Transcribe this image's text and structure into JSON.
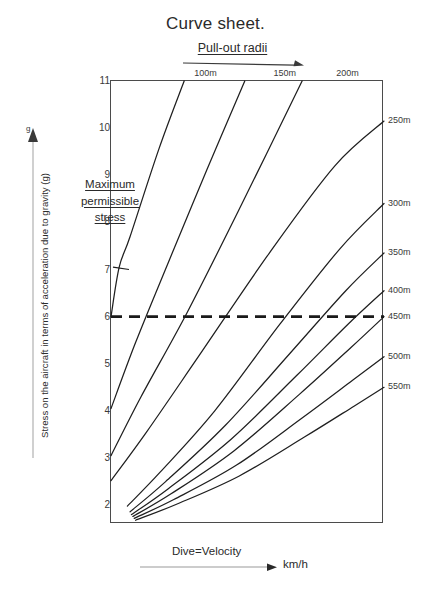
{
  "title": "Curve sheet.",
  "pullout": {
    "label": "Pull-out radii",
    "arrow_icon": "arrow-right-icon"
  },
  "annotation": {
    "line1": "Maximum",
    "line2": "permissible",
    "line3": "stress"
  },
  "yaxis": {
    "caption": "Stress on the aircraft in terms of acceleration due to gravity (g)",
    "unit_marker": "g",
    "arrow_icon": "arrow-up-icon",
    "ticks": [
      11,
      10,
      9,
      8,
      7,
      6,
      5,
      4,
      3,
      2
    ]
  },
  "xaxis": {
    "label": "Dive=Velocity",
    "unit": "km/h",
    "arrow_icon": "arrow-right-icon"
  },
  "chart_data": {
    "type": "line",
    "title": "Curve sheet.",
    "xlabel": "Dive=Velocity  km/h",
    "ylabel": "Stress on the aircraft in terms of acceleration due to gravity (g)",
    "ylim": [
      1.6,
      11
    ],
    "yticks": [
      2,
      3,
      4,
      5,
      6,
      7,
      8,
      9,
      10,
      11
    ],
    "xlim": [
      0,
      1
    ],
    "xticks": [],
    "grid": false,
    "legend_position": "curve-end-labels",
    "annotations": [
      {
        "text": "Maximum permissible stress",
        "kind": "pointer-to-leftmost-curve",
        "x": 0.0,
        "y": 8.6
      },
      {
        "text": "Pull-out radii",
        "kind": "top-axis-direction-arrow",
        "direction": "right"
      },
      {
        "text": "Dive=Velocity",
        "kind": "bottom-axis-direction-arrow",
        "direction": "right"
      }
    ],
    "reference_lines": [
      {
        "orientation": "horizontal",
        "value": 6,
        "style": "dashed",
        "label": "Maximum permissible stress",
        "color": "#1a1a1a"
      }
    ],
    "series": [
      {
        "name": "100m",
        "label_position": "top",
        "label_x_frac": 0.35,
        "exits": "top",
        "points": [
          [
            0.0,
            6.0
          ],
          [
            0.03,
            7.05
          ],
          [
            0.07,
            7.7
          ],
          [
            0.175,
            9.55
          ],
          [
            0.268,
            11.0
          ]
        ]
      },
      {
        "name": "150m",
        "label_position": "top",
        "label_x_frac": 0.64,
        "exits": "top",
        "points": [
          [
            0.0,
            4.05
          ],
          [
            0.09,
            5.45
          ],
          [
            0.21,
            7.15
          ],
          [
            0.35,
            9.1
          ],
          [
            0.49,
            11.0
          ]
        ]
      },
      {
        "name": "200m",
        "label_position": "top",
        "label_x_frac": 0.87,
        "exits": "top",
        "points": [
          [
            0.0,
            3.05
          ],
          [
            0.11,
            4.3
          ],
          [
            0.28,
            6.1
          ],
          [
            0.48,
            8.4
          ],
          [
            0.7,
            11.0
          ]
        ]
      },
      {
        "name": "250m",
        "label_position": "right",
        "label_y": 10.15,
        "exits": "right",
        "points": [
          [
            0.0,
            2.52
          ],
          [
            0.13,
            3.55
          ],
          [
            0.32,
            5.15
          ],
          [
            0.58,
            7.35
          ],
          [
            0.82,
            9.2
          ],
          [
            1.0,
            10.15
          ]
        ]
      },
      {
        "name": "300m",
        "label_position": "right",
        "label_y": 8.4,
        "exits": "right",
        "points": [
          [
            0.06,
            1.98
          ],
          [
            0.18,
            2.7
          ],
          [
            0.38,
            4.0
          ],
          [
            0.62,
            5.85
          ],
          [
            0.84,
            7.45
          ],
          [
            1.0,
            8.4
          ]
        ]
      },
      {
        "name": "350m",
        "label_position": "right",
        "label_y": 7.35,
        "exits": "right",
        "points": [
          [
            0.07,
            1.86
          ],
          [
            0.2,
            2.5
          ],
          [
            0.42,
            3.7
          ],
          [
            0.66,
            5.25
          ],
          [
            0.86,
            6.55
          ],
          [
            1.0,
            7.35
          ]
        ]
      },
      {
        "name": "400m",
        "label_position": "right",
        "label_y": 6.55,
        "exits": "right",
        "points": [
          [
            0.075,
            1.8
          ],
          [
            0.21,
            2.35
          ],
          [
            0.44,
            3.4
          ],
          [
            0.68,
            4.75
          ],
          [
            0.87,
            5.85
          ],
          [
            1.0,
            6.55
          ]
        ]
      },
      {
        "name": "450m",
        "label_position": "right",
        "label_y": 6.0,
        "exits": "right",
        "points": [
          [
            0.08,
            1.76
          ],
          [
            0.22,
            2.24
          ],
          [
            0.45,
            3.15
          ],
          [
            0.69,
            4.35
          ],
          [
            0.88,
            5.35
          ],
          [
            1.0,
            6.0
          ]
        ]
      },
      {
        "name": "500m",
        "label_position": "right",
        "label_y": 5.15,
        "exits": "right",
        "points": [
          [
            0.085,
            1.72
          ],
          [
            0.23,
            2.12
          ],
          [
            0.46,
            2.85
          ],
          [
            0.7,
            3.85
          ],
          [
            0.885,
            4.65
          ],
          [
            1.0,
            5.15
          ]
        ]
      },
      {
        "name": "550m",
        "label_position": "right",
        "label_y": 4.5,
        "exits": "right",
        "points": [
          [
            0.09,
            1.68
          ],
          [
            0.24,
            2.02
          ],
          [
            0.47,
            2.62
          ],
          [
            0.71,
            3.45
          ],
          [
            0.89,
            4.1
          ],
          [
            1.0,
            4.5
          ]
        ]
      }
    ]
  }
}
